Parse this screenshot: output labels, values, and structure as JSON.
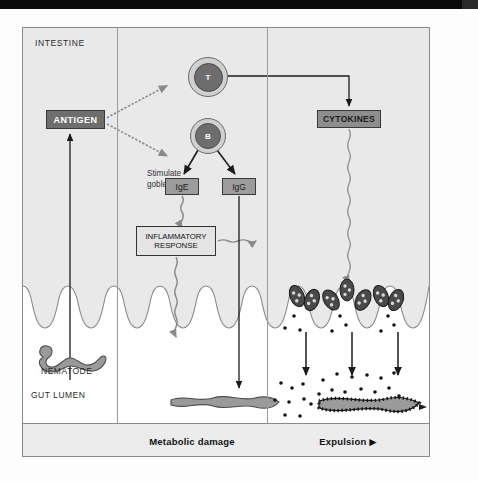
{
  "figure": {
    "region_label": "INTESTINE",
    "lumen_label": "GUT LUMEN",
    "parasite_label": "NEMATODE"
  },
  "panels": [
    {
      "id": "antigen-panel",
      "footer_label": ""
    },
    {
      "id": "metabolic-panel",
      "footer_label": "Metabolic damage"
    },
    {
      "id": "expulsion-panel",
      "footer_label": "Expulsion  ▶"
    }
  ],
  "nodes": {
    "antigen": "ANTIGEN",
    "t_cell": "T",
    "b_cell": "B",
    "ige": "IgE",
    "igg": "IgG",
    "inflammatory": "INFLAMMATORY\nRESPONSE",
    "cytokines": "CYTOKINES",
    "stimulate": "Stimulate\ngoblet cells"
  },
  "colors": {
    "panel_background": "#e9e9e9",
    "lumen_background": "#ffffff",
    "antigen_fill": "#6e6e6e",
    "antigen_text": "#ffffff",
    "cytokines_fill": "#8d8d8d",
    "antibody_fill": "#9c9c9c",
    "inflammatory_fill": "#e4e4e4",
    "cell_outer": "#d0d0d0",
    "cell_core": "#6d6d6d",
    "worm_fill": "#9a9a9a",
    "goblet_fill": "#4a4a4a",
    "stroke": "#333333",
    "wavy_arrow": "#8a8a8a",
    "frame": "#8a8a8a"
  },
  "graphics": {
    "nematode_icon": "worm-squiggle",
    "damaged_worm_icon": "worm-flattened",
    "expelled_worm_icon": "worm-mucus-coated",
    "goblet_cell_icon": "goblet-cell",
    "mucus_granule_icon": "mucus-granule",
    "villi_icon": "intestinal-villi"
  }
}
